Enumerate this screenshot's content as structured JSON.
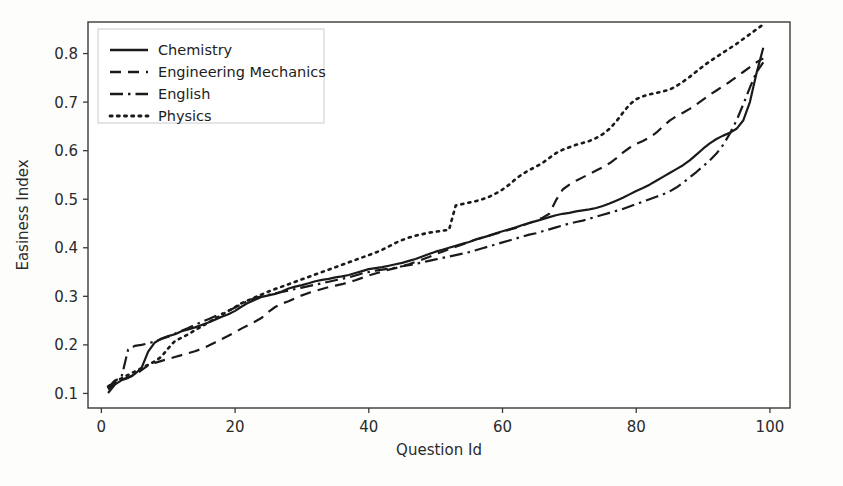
{
  "chart_data": {
    "type": "line",
    "title": "",
    "xlabel": "Question Id",
    "ylabel": "Easiness Index",
    "xlim": [
      -2,
      103
    ],
    "ylim": [
      0.07,
      0.865
    ],
    "xticks": [
      0,
      20,
      40,
      60,
      80,
      100
    ],
    "yticks": [
      0.1,
      0.2,
      0.3,
      0.4,
      0.5,
      0.6,
      0.7,
      0.8
    ],
    "xtick_labels": [
      "0",
      "20",
      "40",
      "60",
      "80",
      "100"
    ],
    "ytick_labels": [
      "0.1",
      "0.2",
      "0.3",
      "0.4",
      "0.5",
      "0.6",
      "0.7",
      "0.8"
    ],
    "grid": false,
    "legend_position": "upper left",
    "line_color": "#1a1a1a",
    "series": [
      {
        "name": "Chemistry",
        "style": "solid",
        "x": [
          1,
          2,
          3,
          4,
          5,
          6,
          7,
          8,
          9,
          10,
          11,
          12,
          13,
          14,
          15,
          16,
          17,
          18,
          19,
          20,
          21,
          22,
          23,
          24,
          25,
          26,
          27,
          28,
          29,
          30,
          31,
          32,
          33,
          34,
          35,
          36,
          37,
          38,
          39,
          40,
          41,
          42,
          43,
          44,
          45,
          46,
          47,
          48,
          49,
          50,
          51,
          52,
          53,
          54,
          55,
          56,
          57,
          58,
          59,
          60,
          61,
          62,
          63,
          64,
          65,
          66,
          67,
          68,
          69,
          70,
          71,
          72,
          73,
          74,
          75,
          76,
          77,
          78,
          79,
          80,
          81,
          82,
          83,
          84,
          85,
          86,
          87,
          88,
          89,
          90,
          91,
          92,
          93,
          94,
          95,
          96,
          97,
          98,
          99
        ],
        "y": [
          0.101,
          0.118,
          0.127,
          0.132,
          0.14,
          0.152,
          0.186,
          0.205,
          0.213,
          0.218,
          0.222,
          0.228,
          0.232,
          0.236,
          0.241,
          0.246,
          0.252,
          0.258,
          0.263,
          0.27,
          0.279,
          0.287,
          0.293,
          0.299,
          0.302,
          0.305,
          0.31,
          0.316,
          0.32,
          0.323,
          0.327,
          0.331,
          0.334,
          0.336,
          0.339,
          0.341,
          0.344,
          0.348,
          0.352,
          0.356,
          0.358,
          0.36,
          0.363,
          0.366,
          0.369,
          0.373,
          0.377,
          0.382,
          0.387,
          0.392,
          0.396,
          0.4,
          0.404,
          0.408,
          0.412,
          0.417,
          0.421,
          0.425,
          0.43,
          0.434,
          0.438,
          0.442,
          0.447,
          0.451,
          0.455,
          0.459,
          0.463,
          0.467,
          0.47,
          0.472,
          0.475,
          0.477,
          0.479,
          0.482,
          0.486,
          0.491,
          0.497,
          0.503,
          0.51,
          0.517,
          0.523,
          0.53,
          0.538,
          0.546,
          0.554,
          0.562,
          0.57,
          0.58,
          0.592,
          0.604,
          0.615,
          0.624,
          0.631,
          0.637,
          0.645,
          0.662,
          0.7,
          0.76,
          0.812
        ]
      },
      {
        "name": "Engineering Mechanics",
        "style": "dashed",
        "x": [
          1,
          2,
          3,
          4,
          5,
          6,
          7,
          8,
          9,
          10,
          11,
          12,
          13,
          14,
          15,
          16,
          17,
          18,
          19,
          20,
          21,
          22,
          23,
          24,
          25,
          26,
          27,
          28,
          29,
          30,
          31,
          32,
          33,
          34,
          35,
          36,
          37,
          38,
          39,
          40,
          41,
          42,
          43,
          44,
          45,
          46,
          47,
          48,
          49,
          50,
          51,
          52,
          53,
          54,
          55,
          56,
          57,
          58,
          59,
          60,
          61,
          62,
          63,
          64,
          65,
          66,
          67,
          68,
          69,
          70,
          71,
          72,
          73,
          74,
          75,
          76,
          77,
          78,
          79,
          80,
          81,
          82,
          83,
          84,
          85,
          86,
          87,
          88,
          89,
          90,
          91,
          92,
          93,
          94,
          95,
          96,
          97,
          98,
          99
        ],
        "y": [
          0.108,
          0.121,
          0.128,
          0.133,
          0.138,
          0.148,
          0.158,
          0.163,
          0.167,
          0.171,
          0.175,
          0.179,
          0.183,
          0.187,
          0.192,
          0.198,
          0.205,
          0.212,
          0.219,
          0.226,
          0.234,
          0.241,
          0.248,
          0.256,
          0.268,
          0.278,
          0.285,
          0.29,
          0.296,
          0.302,
          0.307,
          0.311,
          0.315,
          0.319,
          0.322,
          0.325,
          0.329,
          0.333,
          0.338,
          0.343,
          0.347,
          0.351,
          0.355,
          0.358,
          0.362,
          0.366,
          0.371,
          0.376,
          0.381,
          0.387,
          0.392,
          0.397,
          0.402,
          0.407,
          0.412,
          0.417,
          0.421,
          0.425,
          0.429,
          0.433,
          0.437,
          0.441,
          0.446,
          0.451,
          0.456,
          0.462,
          0.47,
          0.498,
          0.52,
          0.53,
          0.538,
          0.545,
          0.552,
          0.559,
          0.566,
          0.574,
          0.584,
          0.596,
          0.606,
          0.614,
          0.62,
          0.627,
          0.637,
          0.65,
          0.662,
          0.671,
          0.678,
          0.686,
          0.695,
          0.705,
          0.715,
          0.724,
          0.733,
          0.742,
          0.752,
          0.762,
          0.772,
          0.782,
          0.79
        ]
      },
      {
        "name": "English",
        "style": "dashdot",
        "x": [
          1,
          2,
          3,
          4,
          5,
          6,
          7,
          8,
          9,
          10,
          11,
          12,
          13,
          14,
          15,
          16,
          17,
          18,
          19,
          20,
          21,
          22,
          23,
          24,
          25,
          26,
          27,
          28,
          29,
          30,
          31,
          32,
          33,
          34,
          35,
          36,
          37,
          38,
          39,
          40,
          41,
          42,
          43,
          44,
          45,
          46,
          47,
          48,
          49,
          50,
          51,
          52,
          53,
          54,
          55,
          56,
          57,
          58,
          59,
          60,
          61,
          62,
          63,
          64,
          65,
          66,
          67,
          68,
          69,
          70,
          71,
          72,
          73,
          74,
          75,
          76,
          77,
          78,
          79,
          80,
          81,
          82,
          83,
          84,
          85,
          86,
          87,
          88,
          89,
          90,
          91,
          92,
          93,
          94,
          95,
          96,
          97,
          98,
          99
        ],
        "y": [
          0.112,
          0.126,
          0.133,
          0.19,
          0.198,
          0.2,
          0.203,
          0.207,
          0.212,
          0.217,
          0.223,
          0.229,
          0.235,
          0.241,
          0.247,
          0.253,
          0.259,
          0.264,
          0.27,
          0.277,
          0.284,
          0.291,
          0.297,
          0.3,
          0.303,
          0.306,
          0.309,
          0.312,
          0.315,
          0.318,
          0.321,
          0.324,
          0.327,
          0.33,
          0.333,
          0.336,
          0.339,
          0.343,
          0.347,
          0.35,
          0.353,
          0.355,
          0.357,
          0.359,
          0.362,
          0.364,
          0.367,
          0.37,
          0.373,
          0.376,
          0.379,
          0.382,
          0.385,
          0.388,
          0.391,
          0.395,
          0.399,
          0.403,
          0.407,
          0.411,
          0.415,
          0.419,
          0.423,
          0.427,
          0.43,
          0.434,
          0.438,
          0.442,
          0.446,
          0.45,
          0.453,
          0.456,
          0.46,
          0.464,
          0.468,
          0.472,
          0.476,
          0.48,
          0.485,
          0.49,
          0.495,
          0.5,
          0.505,
          0.51,
          0.516,
          0.524,
          0.534,
          0.545,
          0.556,
          0.568,
          0.58,
          0.594,
          0.612,
          0.635,
          0.662,
          0.695,
          0.73,
          0.762,
          0.782
        ]
      },
      {
        "name": "Physics",
        "style": "dotted",
        "x": [
          1,
          2,
          3,
          4,
          5,
          6,
          7,
          8,
          9,
          10,
          11,
          12,
          13,
          14,
          15,
          16,
          17,
          18,
          19,
          20,
          21,
          22,
          23,
          24,
          25,
          26,
          27,
          28,
          29,
          30,
          31,
          32,
          33,
          34,
          35,
          36,
          37,
          38,
          39,
          40,
          41,
          42,
          43,
          44,
          45,
          46,
          47,
          48,
          49,
          50,
          51,
          52,
          53,
          54,
          55,
          56,
          57,
          58,
          59,
          60,
          61,
          62,
          63,
          64,
          65,
          66,
          67,
          68,
          69,
          70,
          71,
          72,
          73,
          74,
          75,
          76,
          77,
          78,
          79,
          80,
          81,
          82,
          83,
          84,
          85,
          86,
          87,
          88,
          89,
          90,
          91,
          92,
          93,
          94,
          95,
          96,
          97,
          98,
          99
        ],
        "y": [
          0.114,
          0.125,
          0.131,
          0.138,
          0.145,
          0.152,
          0.159,
          0.166,
          0.176,
          0.193,
          0.208,
          0.215,
          0.222,
          0.23,
          0.238,
          0.246,
          0.254,
          0.262,
          0.27,
          0.278,
          0.286,
          0.292,
          0.298,
          0.304,
          0.31,
          0.315,
          0.32,
          0.325,
          0.33,
          0.335,
          0.34,
          0.345,
          0.35,
          0.355,
          0.36,
          0.365,
          0.37,
          0.375,
          0.38,
          0.385,
          0.39,
          0.396,
          0.403,
          0.41,
          0.416,
          0.421,
          0.425,
          0.428,
          0.431,
          0.433,
          0.435,
          0.437,
          0.487,
          0.49,
          0.493,
          0.496,
          0.5,
          0.505,
          0.512,
          0.52,
          0.53,
          0.542,
          0.552,
          0.56,
          0.567,
          0.575,
          0.585,
          0.595,
          0.602,
          0.607,
          0.612,
          0.616,
          0.62,
          0.626,
          0.634,
          0.645,
          0.66,
          0.678,
          0.695,
          0.706,
          0.712,
          0.716,
          0.719,
          0.722,
          0.726,
          0.733,
          0.742,
          0.752,
          0.763,
          0.774,
          0.784,
          0.793,
          0.802,
          0.811,
          0.82,
          0.83,
          0.84,
          0.85,
          0.86
        ]
      }
    ]
  },
  "legend": {
    "entries": [
      {
        "label": "Chemistry",
        "style": "solid"
      },
      {
        "label": "Engineering Mechanics",
        "style": "dashed"
      },
      {
        "label": "English",
        "style": "dashdot"
      },
      {
        "label": "Physics",
        "style": "dotted"
      }
    ]
  }
}
